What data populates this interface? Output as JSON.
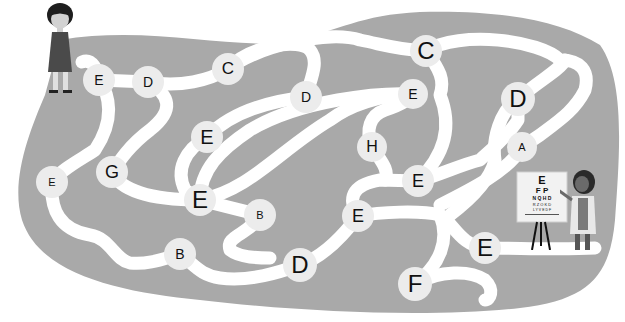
{
  "puzzle": {
    "type": "letter maze",
    "colors": {
      "background": "#ffffff",
      "maze_area": "#a9a9a9",
      "path": "#ffffff",
      "node": "#ececec",
      "letter": "#111111"
    },
    "start": "girl",
    "finish": "eye doctor with eye chart",
    "nodes": [
      {
        "letter": "E",
        "x": 99,
        "y": 80,
        "r": 16,
        "size": 14
      },
      {
        "letter": "D",
        "x": 148,
        "y": 82,
        "r": 16,
        "size": 14
      },
      {
        "letter": "C",
        "x": 228,
        "y": 69,
        "r": 16,
        "size": 17
      },
      {
        "letter": "D",
        "x": 306,
        "y": 97,
        "r": 16,
        "size": 14
      },
      {
        "letter": "C",
        "x": 426,
        "y": 51,
        "r": 16,
        "size": 24
      },
      {
        "letter": "E",
        "x": 413,
        "y": 94,
        "r": 15,
        "size": 14
      },
      {
        "letter": "D",
        "x": 518,
        "y": 99,
        "r": 17,
        "size": 24
      },
      {
        "letter": "E",
        "x": 207,
        "y": 137,
        "r": 16,
        "size": 20
      },
      {
        "letter": "H",
        "x": 372,
        "y": 147,
        "r": 15,
        "size": 16
      },
      {
        "letter": "A",
        "x": 522,
        "y": 147,
        "r": 15,
        "size": 11
      },
      {
        "letter": "E",
        "x": 52,
        "y": 182,
        "r": 16,
        "size": 11
      },
      {
        "letter": "G",
        "x": 112,
        "y": 172,
        "r": 16,
        "size": 18
      },
      {
        "letter": "E",
        "x": 418,
        "y": 181,
        "r": 16,
        "size": 18
      },
      {
        "letter": "E",
        "x": 200,
        "y": 200,
        "r": 16,
        "size": 24
      },
      {
        "letter": "B",
        "x": 260,
        "y": 215,
        "r": 16,
        "size": 11
      },
      {
        "letter": "E",
        "x": 358,
        "y": 216,
        "r": 16,
        "size": 18
      },
      {
        "letter": "B",
        "x": 180,
        "y": 254,
        "r": 16,
        "size": 14
      },
      {
        "letter": "D",
        "x": 300,
        "y": 265,
        "r": 17,
        "size": 24
      },
      {
        "letter": "E",
        "x": 485,
        "y": 248,
        "r": 16,
        "size": 24
      },
      {
        "letter": "F",
        "x": 415,
        "y": 284,
        "r": 17,
        "size": 24
      }
    ],
    "eye_chart": {
      "rows": [
        "E",
        "F P",
        "N Q H D",
        "R Z O K D",
        "L Y V E D F"
      ]
    }
  }
}
